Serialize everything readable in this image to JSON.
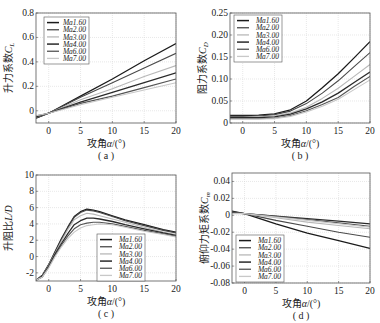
{
  "figure": {
    "background": "#ffffff",
    "grid_color": "#d8d8d8",
    "axis_color": "#555555"
  },
  "chart_data": [
    {
      "id": "a",
      "type": "line",
      "panel_label": "( a )",
      "xlabel": "攻角α/(°)",
      "ylabel": "升力系数C_L",
      "ylabel_main": "升力系数",
      "ylabel_sym": "C",
      "ylabel_sub": "L",
      "xlim": [
        -2,
        20
      ],
      "ylim": [
        -0.1,
        0.8
      ],
      "xticks": [
        0,
        5,
        10,
        15,
        20
      ],
      "yticks": [
        0,
        0.2,
        0.4,
        0.6,
        0.8
      ],
      "ytick_labels": [
        "0",
        "0.2",
        "0.4",
        "0.6",
        "0.8"
      ],
      "grid": true,
      "legend_position": "upper-left",
      "box": {
        "x": 36,
        "y": 13,
        "w": 140,
        "h": 110
      },
      "legend": {
        "x": 44,
        "y": 17,
        "w": 45,
        "h": 47
      },
      "x": [
        -2,
        0,
        5,
        10,
        15,
        20
      ],
      "series": [
        {
          "name": "Ma1.60",
          "color": "#1a1a1a",
          "width": 1.3,
          "values": [
            -0.06,
            -0.02,
            0.12,
            0.26,
            0.41,
            0.55
          ]
        },
        {
          "name": "Ma2.00",
          "color": "#4a4a4a",
          "width": 1.1,
          "values": [
            -0.06,
            -0.02,
            0.11,
            0.23,
            0.35,
            0.47
          ]
        },
        {
          "name": "Ma3.00",
          "color": "#b8b8b8",
          "width": 1.1,
          "values": [
            -0.05,
            -0.02,
            0.09,
            0.18,
            0.28,
            0.37
          ]
        },
        {
          "name": "Ma4.00",
          "color": "#2a2a2a",
          "width": 1.3,
          "values": [
            -0.05,
            -0.02,
            0.07,
            0.15,
            0.23,
            0.31
          ]
        },
        {
          "name": "Ma6.00",
          "color": "#555555",
          "width": 1.1,
          "values": [
            -0.04,
            -0.02,
            0.06,
            0.12,
            0.19,
            0.26
          ]
        },
        {
          "name": "Ma7.00",
          "color": "#c8c8c8",
          "width": 1.1,
          "values": [
            -0.04,
            -0.02,
            0.05,
            0.11,
            0.17,
            0.23
          ]
        }
      ]
    },
    {
      "id": "b",
      "type": "line",
      "panel_label": "( b )",
      "xlabel": "攻角α/(°)",
      "ylabel": "阻力系数C_D",
      "ylabel_main": "阻力系数",
      "ylabel_sym": "C",
      "ylabel_sub": "D",
      "xlim": [
        -2,
        20
      ],
      "ylim": [
        0,
        0.25
      ],
      "xticks": [
        0,
        5,
        10,
        15,
        20
      ],
      "yticks": [
        0,
        0.05,
        0.1,
        0.15,
        0.2,
        0.25
      ],
      "ytick_labels": [
        "0",
        "0.05",
        "0.10",
        "0.15",
        "0.20",
        "0.25"
      ],
      "grid": true,
      "legend_position": "upper-left",
      "box": {
        "x": 230,
        "y": 13,
        "w": 140,
        "h": 110
      },
      "legend": {
        "x": 234,
        "y": 15,
        "w": 48,
        "h": 47
      },
      "x": [
        -2,
        0,
        2.5,
        5,
        7.5,
        10,
        12.5,
        15,
        17.5,
        20
      ],
      "series": [
        {
          "name": "Ma1.60",
          "color": "#1a1a1a",
          "width": 1.3,
          "values": [
            0.017,
            0.017,
            0.018,
            0.021,
            0.03,
            0.05,
            0.08,
            0.112,
            0.148,
            0.185
          ]
        },
        {
          "name": "Ma2.00",
          "color": "#4a4a4a",
          "width": 1.1,
          "values": [
            0.015,
            0.015,
            0.016,
            0.019,
            0.027,
            0.044,
            0.068,
            0.096,
            0.128,
            0.16
          ]
        },
        {
          "name": "Ma3.00",
          "color": "#b8b8b8",
          "width": 1.1,
          "values": [
            0.013,
            0.013,
            0.014,
            0.016,
            0.023,
            0.036,
            0.056,
            0.079,
            0.106,
            0.133
          ]
        },
        {
          "name": "Ma4.00",
          "color": "#2a2a2a",
          "width": 1.3,
          "values": [
            0.012,
            0.012,
            0.012,
            0.014,
            0.02,
            0.032,
            0.048,
            0.068,
            0.092,
            0.116
          ]
        },
        {
          "name": "Ma6.00",
          "color": "#555555",
          "width": 1.1,
          "values": [
            0.01,
            0.01,
            0.01,
            0.011,
            0.017,
            0.028,
            0.042,
            0.058,
            0.083,
            0.106
          ]
        },
        {
          "name": "Ma7.00",
          "color": "#c8c8c8",
          "width": 1.1,
          "values": [
            0.009,
            0.009,
            0.009,
            0.01,
            0.015,
            0.025,
            0.038,
            0.054,
            0.076,
            0.098
          ]
        }
      ]
    },
    {
      "id": "c",
      "type": "line",
      "panel_label": "( c )",
      "xlabel": "攻角α/(°)",
      "ylabel": "升阻比L/D",
      "ylabel_main": "升阻比",
      "ylabel_sym": "L/D",
      "ylabel_sub": "",
      "xlim": [
        -2,
        20
      ],
      "ylim": [
        -3,
        10
      ],
      "xticks": [
        0,
        5,
        10,
        15,
        20
      ],
      "yticks": [
        -2,
        0,
        2,
        4,
        6,
        8,
        10
      ],
      "ytick_labels": [
        "-2",
        "0",
        "2",
        "4",
        "6",
        "8",
        "10"
      ],
      "grid": true,
      "legend_position": "lower-right",
      "box": {
        "x": 36,
        "y": 175,
        "w": 140,
        "h": 106
      },
      "legend": {
        "x": 97,
        "y": 234,
        "w": 48,
        "h": 47
      },
      "x": [
        -2,
        -1,
        0,
        1,
        2,
        3,
        4,
        5,
        6,
        7,
        8,
        10,
        12,
        15,
        18,
        20
      ],
      "series": [
        {
          "name": "Ma1.60",
          "color": "#1a1a1a",
          "width": 1.3,
          "values": [
            -2.9,
            -2.3,
            -1.0,
            0.6,
            2.2,
            3.6,
            4.9,
            5.5,
            5.8,
            5.7,
            5.5,
            5.0,
            4.5,
            3.9,
            3.3,
            3.0
          ]
        },
        {
          "name": "Ma2.00",
          "color": "#4a4a4a",
          "width": 1.1,
          "values": [
            -2.9,
            -2.3,
            -1.0,
            0.5,
            2.1,
            3.5,
            4.8,
            5.4,
            5.7,
            5.6,
            5.4,
            4.9,
            4.4,
            3.8,
            3.2,
            2.9
          ]
        },
        {
          "name": "Ma3.00",
          "color": "#b8b8b8",
          "width": 1.1,
          "values": [
            -2.9,
            -2.4,
            -1.1,
            0.4,
            1.9,
            3.3,
            4.5,
            5.0,
            5.3,
            5.2,
            5.0,
            4.6,
            4.2,
            3.6,
            3.0,
            2.7
          ]
        },
        {
          "name": "Ma4.00",
          "color": "#2a2a2a",
          "width": 1.3,
          "values": [
            -2.9,
            -2.4,
            -1.2,
            0.3,
            1.6,
            2.8,
            3.9,
            4.4,
            4.7,
            4.7,
            4.6,
            4.3,
            3.9,
            3.4,
            2.9,
            2.6
          ]
        },
        {
          "name": "Ma6.00",
          "color": "#555555",
          "width": 1.1,
          "values": [
            -2.9,
            -2.5,
            -1.3,
            0.1,
            1.4,
            2.5,
            3.4,
            3.9,
            4.1,
            4.2,
            4.2,
            4.0,
            3.7,
            3.2,
            2.8,
            2.5
          ]
        },
        {
          "name": "Ma7.00",
          "color": "#c8c8c8",
          "width": 1.1,
          "values": [
            -2.9,
            -2.5,
            -1.4,
            0.0,
            1.2,
            2.2,
            3.0,
            3.5,
            3.8,
            3.9,
            4.0,
            3.9,
            3.6,
            3.1,
            2.7,
            2.4
          ]
        }
      ]
    },
    {
      "id": "d",
      "type": "line",
      "panel_label": "( d )",
      "xlabel": "攻角α/(°)",
      "ylabel": "俯仰力矩系数C_m",
      "ylabel_main": "俯仰力矩系数",
      "ylabel_sym": "C",
      "ylabel_sub": "m",
      "xlim": [
        -2,
        20
      ],
      "ylim": [
        -0.08,
        0.05
      ],
      "xticks": [
        0,
        5,
        10,
        15,
        20
      ],
      "yticks": [
        -0.08,
        -0.06,
        -0.04,
        -0.02,
        0,
        0.02,
        0.04
      ],
      "ytick_labels": [
        "-0.08",
        "-0.06",
        "-0.04",
        "-0.02",
        "0",
        "0.02",
        "0.04"
      ],
      "grid": true,
      "legend_position": "lower-left",
      "box": {
        "x": 232,
        "y": 173,
        "w": 138,
        "h": 110
      },
      "legend": {
        "x": 236,
        "y": 235,
        "w": 48,
        "h": 47
      },
      "x": [
        -2,
        0,
        5,
        10,
        15,
        20
      ],
      "series": [
        {
          "name": "Ma1.60",
          "color": "#1a1a1a",
          "width": 1.3,
          "values": [
            0.005,
            0.002,
            -0.01,
            -0.021,
            -0.03,
            -0.039
          ]
        },
        {
          "name": "Ma2.00",
          "color": "#4a4a4a",
          "width": 1.1,
          "values": [
            0.004,
            0.002,
            -0.006,
            -0.013,
            -0.02,
            -0.026
          ]
        },
        {
          "name": "Ma3.00",
          "color": "#b8b8b8",
          "width": 1.1,
          "values": [
            0.003,
            0.002,
            -0.003,
            -0.008,
            -0.012,
            -0.016
          ]
        },
        {
          "name": "Ma4.00",
          "color": "#2a2a2a",
          "width": 1.3,
          "values": [
            0.003,
            0.002,
            -0.001,
            -0.004,
            -0.007,
            -0.01
          ]
        },
        {
          "name": "Ma6.00",
          "color": "#555555",
          "width": 1.1,
          "values": [
            0.003,
            0.002,
            -0.001,
            -0.005,
            -0.009,
            -0.013
          ]
        },
        {
          "name": "Ma7.00",
          "color": "#c8c8c8",
          "width": 1.1,
          "values": [
            0.002,
            0.002,
            -0.002,
            -0.006,
            -0.01,
            -0.014
          ]
        }
      ]
    }
  ]
}
